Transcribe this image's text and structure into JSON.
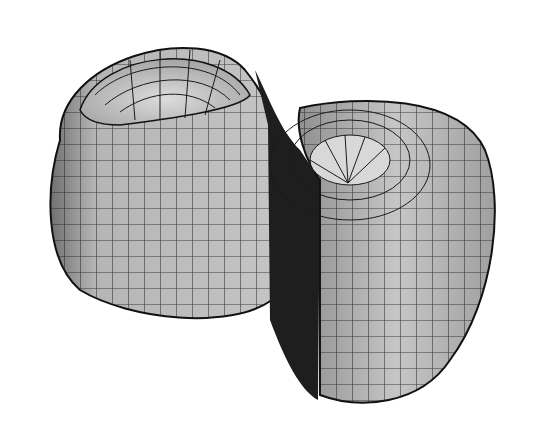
{
  "figure": {
    "colors": {
      "background": "#ffffff",
      "surface_light": "#c8c8c8",
      "surface_mid": "#a8a8a8",
      "surface_dark": "#1e1e1e",
      "grid_lines": "#1a1a1a"
    }
  }
}
